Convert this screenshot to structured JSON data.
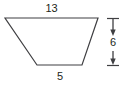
{
  "figure": {
    "type": "geometry-diagram",
    "shape_name": "trapezoid",
    "background_color": "#ffffff",
    "stroke_color": "#3f3f42",
    "text_color": "#231f20",
    "fill": "none",
    "labels": {
      "top_base": "13",
      "bottom_base": "5",
      "height": "6"
    },
    "measurements": [
      {
        "name": "top-base",
        "value": "13",
        "orientation": "horizontal",
        "position": "above-shape"
      },
      {
        "name": "bottom-base",
        "value": "5",
        "orientation": "horizontal",
        "position": "below-shape"
      },
      {
        "name": "height",
        "value": "6",
        "orientation": "vertical",
        "position": "right-of-shape"
      }
    ],
    "vertices": {
      "top_left": {
        "x": 5,
        "y": 18
      },
      "top_right": {
        "x": 98,
        "y": 18
      },
      "bottom_right": {
        "x": 82,
        "y": 65
      },
      "bottom_left": {
        "x": 37,
        "y": 65
      }
    },
    "dimension_line": {
      "x": 113,
      "y_top": 18,
      "y_bottom": 65,
      "tick_half_width": 6,
      "has_arrow_top": true,
      "has_arrow_bottom": true
    }
  }
}
